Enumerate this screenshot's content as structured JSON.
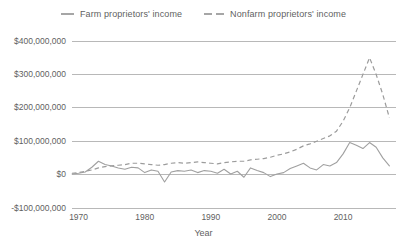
{
  "chart_data": {
    "type": "line",
    "title": "",
    "xlabel": "Year",
    "ylabel": "",
    "xlim": [
      1969,
      2018
    ],
    "ylim": [
      -100000000,
      400000000
    ],
    "grid": true,
    "legend_position": "top-center",
    "ytick_labels": [
      "$400,000,000",
      "$300,000,000",
      "$200,000,000",
      "$100,000,000",
      "$0",
      "-$100,000,000"
    ],
    "ytick_values": [
      400000000,
      300000000,
      200000000,
      100000000,
      0,
      -100000000
    ],
    "xtick_labels": [
      "1970",
      "1980",
      "1990",
      "2000",
      "2010"
    ],
    "xtick_values": [
      1970,
      1980,
      1990,
      2000,
      2010
    ],
    "x": [
      1969,
      1970,
      1971,
      1972,
      1973,
      1974,
      1975,
      1976,
      1977,
      1978,
      1979,
      1980,
      1981,
      1982,
      1983,
      1984,
      1985,
      1986,
      1987,
      1988,
      1989,
      1990,
      1991,
      1992,
      1993,
      1994,
      1995,
      1996,
      1997,
      1998,
      1999,
      2000,
      2001,
      2002,
      2003,
      2004,
      2005,
      2006,
      2007,
      2008,
      2009,
      2010,
      2011,
      2012,
      2013,
      2014,
      2015,
      2016,
      2017
    ],
    "series": [
      {
        "name": "Farm proprietors' income",
        "style": "solid",
        "color": "#a0a0a0",
        "values": [
          2000000,
          4000000,
          8000000,
          22000000,
          40000000,
          30000000,
          26000000,
          20000000,
          16000000,
          22000000,
          20000000,
          6000000,
          14000000,
          10000000,
          -22000000,
          8000000,
          12000000,
          10000000,
          14000000,
          6000000,
          12000000,
          10000000,
          4000000,
          16000000,
          2000000,
          10000000,
          -8000000,
          20000000,
          12000000,
          6000000,
          -6000000,
          2000000,
          6000000,
          18000000,
          26000000,
          34000000,
          20000000,
          14000000,
          30000000,
          26000000,
          36000000,
          62000000,
          96000000,
          88000000,
          78000000,
          96000000,
          82000000,
          50000000,
          26000000
        ]
      },
      {
        "name": "Nonfarm proprietors' income",
        "style": "dashed",
        "color": "#9c9c9c",
        "values": [
          4000000,
          6000000,
          10000000,
          14000000,
          20000000,
          24000000,
          26000000,
          28000000,
          30000000,
          34000000,
          34000000,
          32000000,
          30000000,
          28000000,
          30000000,
          34000000,
          36000000,
          34000000,
          36000000,
          38000000,
          36000000,
          34000000,
          32000000,
          36000000,
          38000000,
          40000000,
          40000000,
          44000000,
          46000000,
          48000000,
          52000000,
          58000000,
          62000000,
          68000000,
          76000000,
          86000000,
          92000000,
          100000000,
          108000000,
          116000000,
          130000000,
          160000000,
          200000000,
          250000000,
          300000000,
          350000000,
          300000000,
          240000000,
          170000000
        ]
      }
    ]
  },
  "legend": {
    "entries": [
      {
        "label": "Farm proprietors' income"
      },
      {
        "label": "Nonfarm proprietors' income"
      }
    ]
  },
  "axis": {
    "x_title": "Year"
  }
}
